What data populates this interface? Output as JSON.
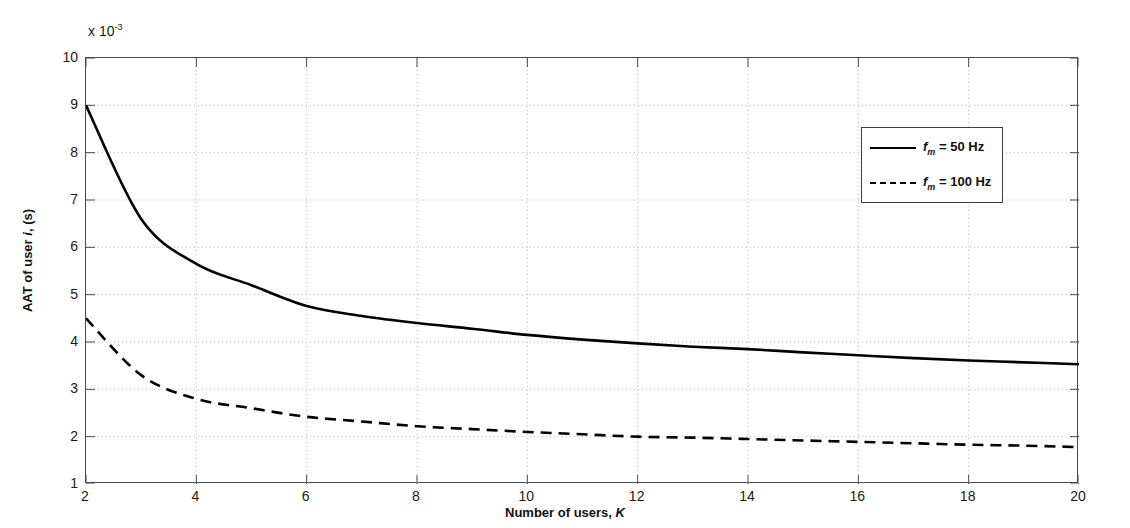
{
  "chart_data": {
    "type": "line",
    "title": "",
    "xlabel": "Number of users, K",
    "xlabel_plain": "Number of users,",
    "xlabel_italic": "K",
    "ylabel": "AAT of user i, (s)",
    "ylabel_pre": "AAT of user",
    "ylabel_italic": "i",
    "ylabel_post": ", (s)",
    "y_exponent_label": "x 10",
    "y_exponent_power": "-3",
    "y_scale_factor": 0.001,
    "xlim": [
      2,
      20
    ],
    "ylim": [
      1,
      10
    ],
    "xticks": [
      2,
      4,
      6,
      8,
      10,
      12,
      14,
      16,
      18,
      20
    ],
    "yticks": [
      1,
      2,
      3,
      4,
      5,
      6,
      7,
      8,
      9,
      10
    ],
    "xtick_labels": [
      "2",
      "4",
      "6",
      "8",
      "10",
      "12",
      "14",
      "16",
      "18",
      "20"
    ],
    "ytick_labels": [
      "1",
      "2",
      "3",
      "4",
      "5",
      "6",
      "7",
      "8",
      "9",
      "10"
    ],
    "grid": true,
    "grid_style": "dotted",
    "grid_color": "#b9b9b9",
    "legend_position": "upper right",
    "line_color": "#000000",
    "x": [
      2,
      3,
      4,
      5,
      6,
      7,
      8,
      9,
      10,
      11,
      12,
      13,
      14,
      15,
      16,
      17,
      18,
      19,
      20
    ],
    "series": [
      {
        "name": "f_m = 50 Hz",
        "label_symbol": "f",
        "label_sub": "m",
        "label_rest": " = 50 Hz",
        "style": "solid",
        "color": "#000000",
        "values": [
          9.0,
          6.6,
          5.65,
          5.2,
          4.76,
          4.55,
          4.4,
          4.28,
          4.15,
          4.05,
          3.97,
          3.9,
          3.85,
          3.78,
          3.72,
          3.66,
          3.61,
          3.57,
          3.53
        ]
      },
      {
        "name": "f_m = 100 Hz",
        "label_symbol": "f",
        "label_sub": "m",
        "label_rest": " = 100 Hz",
        "style": "dashed",
        "color": "#000000",
        "values": [
          4.5,
          3.3,
          2.8,
          2.6,
          2.42,
          2.32,
          2.22,
          2.16,
          2.1,
          2.05,
          2.0,
          1.98,
          1.95,
          1.92,
          1.89,
          1.86,
          1.83,
          1.81,
          1.78
        ]
      }
    ]
  }
}
